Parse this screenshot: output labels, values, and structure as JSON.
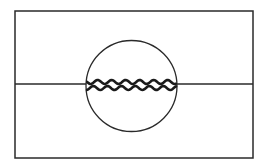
{
  "diagram": {
    "type": "line-drawing",
    "colors": {
      "background": "#ffffff",
      "stroke": "#2a2a2a"
    },
    "frame": {
      "x": 15,
      "y": 11,
      "width": 238,
      "height": 147
    },
    "horizontal_line": {
      "y": 84,
      "x1": 15,
      "x2": 253
    },
    "circle": {
      "cx": 131.5,
      "cy": 86,
      "r": 45.5
    },
    "wavy_lines": [
      {
        "name": "upper-wave",
        "baseline_y": 82,
        "amplitude": 2,
        "period": 14
      },
      {
        "name": "lower-wave",
        "baseline_y": 88,
        "amplitude": 2,
        "period": 14
      }
    ]
  }
}
